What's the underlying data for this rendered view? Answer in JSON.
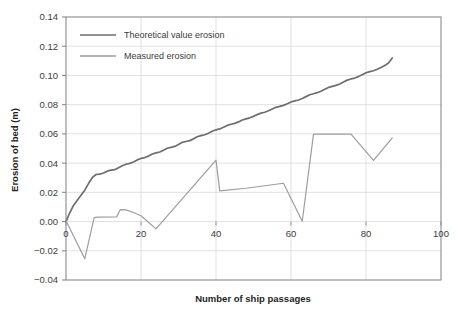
{
  "chart_data": {
    "type": "line",
    "title": "",
    "xlabel": "Number of ship passages",
    "ylabel": "Erosion of bed (m)",
    "xlim": [
      0,
      100
    ],
    "ylim": [
      -0.04,
      0.14
    ],
    "xticks": [
      "0",
      "20",
      "40",
      "60",
      "80",
      "100"
    ],
    "xtick_values": [
      0,
      20,
      40,
      60,
      80,
      100
    ],
    "yticks": [
      "0.14",
      "0.12",
      "0.10",
      "0.08",
      "0.06",
      "0.04",
      "0.02",
      "0.00",
      "-0.02",
      "-0.04"
    ],
    "ytick_values": [
      0.14,
      0.12,
      0.1,
      0.08,
      0.06,
      0.04,
      0.02,
      0.0,
      -0.02,
      -0.04
    ],
    "grid": true,
    "grid_axis": "y",
    "legend_position": "upper-left-inside",
    "series": [
      {
        "name": "Theoretical value erosion",
        "color": "#6e6e6e",
        "x": [
          0,
          1,
          2,
          3,
          4,
          5,
          6,
          7,
          8,
          9,
          10,
          11,
          12,
          13,
          14,
          15,
          16,
          17,
          18,
          19,
          20,
          21,
          22,
          23,
          24,
          25,
          26,
          27,
          28,
          29,
          30,
          31,
          32,
          33,
          34,
          35,
          36,
          37,
          38,
          39,
          40,
          41,
          42,
          43,
          44,
          45,
          46,
          47,
          48,
          49,
          50,
          51,
          52,
          53,
          54,
          55,
          56,
          57,
          58,
          59,
          60,
          61,
          62,
          63,
          64,
          65,
          66,
          67,
          68,
          69,
          70,
          71,
          72,
          73,
          74,
          75,
          76,
          77,
          78,
          79,
          80,
          81,
          82,
          83,
          84,
          85,
          86,
          87
        ],
        "y": [
          0.0,
          0.006,
          0.011,
          0.0145,
          0.018,
          0.0215,
          0.026,
          0.03,
          0.0322,
          0.0325,
          0.0332,
          0.0345,
          0.0352,
          0.0355,
          0.0368,
          0.0382,
          0.0392,
          0.0398,
          0.0408,
          0.0422,
          0.0432,
          0.0438,
          0.0448,
          0.0462,
          0.047,
          0.0476,
          0.0488,
          0.0502,
          0.0508,
          0.0514,
          0.0528,
          0.0542,
          0.0548,
          0.0554,
          0.0566,
          0.058,
          0.0588,
          0.0594,
          0.0605,
          0.0618,
          0.0628,
          0.0634,
          0.0645,
          0.0658,
          0.0666,
          0.0672,
          0.0682,
          0.0695,
          0.0703,
          0.071,
          0.072,
          0.0732,
          0.0742,
          0.0748,
          0.0758,
          0.077,
          0.0782,
          0.0788,
          0.0795,
          0.0806,
          0.0818,
          0.0826,
          0.0832,
          0.0842,
          0.0855,
          0.0868,
          0.0875,
          0.0882,
          0.0892,
          0.0905,
          0.0918,
          0.0925,
          0.0932,
          0.0942,
          0.0955,
          0.0968,
          0.0976,
          0.0982,
          0.0992,
          0.1005,
          0.1018,
          0.1026,
          0.1032,
          0.1042,
          0.1055,
          0.1068,
          0.1085,
          0.112
        ]
      },
      {
        "name": "Measured erosion",
        "color": "#9d9d9d",
        "x": [
          0,
          5,
          7.5,
          8.5,
          13.5,
          14.5,
          16,
          18,
          20,
          24,
          40,
          41,
          48,
          58,
          63,
          66,
          76,
          82,
          87
        ],
        "y": [
          0.0005,
          -0.0255,
          0.0027,
          0.003,
          0.0032,
          0.0082,
          0.008,
          0.0062,
          0.004,
          -0.005,
          0.042,
          0.021,
          0.0228,
          0.0262,
          0.0002,
          0.0598,
          0.0598,
          0.0418,
          0.0572
        ]
      }
    ]
  },
  "legend": {
    "items": [
      {
        "label": "Theoretical value erosion",
        "color": "#6e6e6e"
      },
      {
        "label": "Measured erosion",
        "color": "#9d9d9d"
      }
    ]
  },
  "axes": {
    "x_title": "Number of ship passages",
    "y_title": "Erosion of bed (m)"
  },
  "colors": {
    "theoretical": "#6e6e6e",
    "measured": "#9d9d9d",
    "grid": "#d9d9d9",
    "axis": "#8a8a8a",
    "text": "#231f20",
    "background": "#ffffff"
  }
}
